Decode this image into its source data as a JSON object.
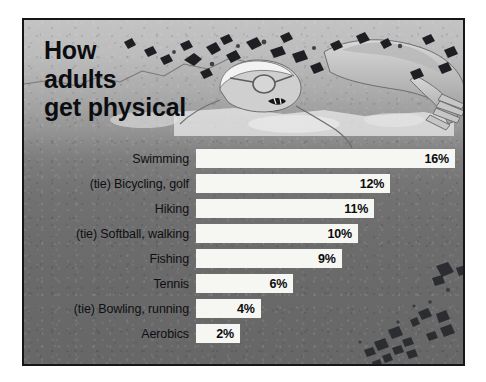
{
  "title": "How\nadults\nget physical",
  "artwork": {
    "name": "swimmer-illustration",
    "description": "freestyle swimmer with cap and goggles"
  },
  "colors": {
    "bar_fill": "#f6f6f2",
    "text": "#0e0f12",
    "frame_border": "#14161a",
    "background_top": "#c3c3c3",
    "background_bottom": "#676767"
  },
  "chart_data": {
    "type": "bar",
    "orientation": "horizontal",
    "title": "How adults get physical",
    "xlabel": "",
    "ylabel": "",
    "xlim": [
      0,
      16
    ],
    "grid": false,
    "legend": false,
    "value_suffix": "%",
    "categories": [
      "Swimming",
      "(tie) Bicycling, golf",
      "Hiking",
      "(tie) Softball, walking",
      "Fishing",
      "Tennis",
      "(tie) Bowling, running",
      "Aerobics"
    ],
    "values": [
      16,
      12,
      11,
      10,
      9,
      6,
      4,
      2
    ],
    "value_labels": [
      "16%",
      "12%",
      "11%",
      "10%",
      "9%",
      "6%",
      "4%",
      "2%"
    ]
  }
}
